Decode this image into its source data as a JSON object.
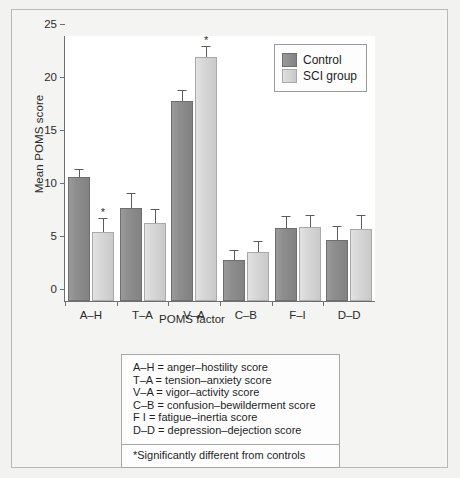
{
  "chart_data": {
    "type": "bar",
    "title": "",
    "xlabel": "POMS factor",
    "ylabel": "Mean POMS score",
    "ylim": [
      0,
      25
    ],
    "yticks": [
      0,
      5,
      10,
      15,
      20,
      25
    ],
    "grid": false,
    "legend_position": "top-right",
    "categories": [
      "A–H",
      "T–A",
      "V–A",
      "C–B",
      "F–I",
      "D–D"
    ],
    "series": [
      {
        "name": "Control",
        "color": "#8a8a8a",
        "values": [
          11.7,
          8.8,
          18.9,
          3.9,
          6.9,
          5.8
        ],
        "errors": [
          0.7,
          1.3,
          0.9,
          0.8,
          1.0,
          1.2
        ],
        "significant": [
          false,
          false,
          false,
          false,
          false,
          false
        ]
      },
      {
        "name": "SCI group",
        "color": "#d4d4d4",
        "values": [
          6.5,
          7.4,
          23.0,
          4.6,
          7.0,
          6.8
        ],
        "errors": [
          1.2,
          1.2,
          1.0,
          1.0,
          1.0,
          1.2
        ],
        "significant": [
          true,
          false,
          true,
          false,
          false,
          false
        ]
      }
    ],
    "annotations": [
      {
        "marker": "*",
        "category": "A–H",
        "series": "SCI group"
      },
      {
        "marker": "*",
        "category": "V–A",
        "series": "SCI group"
      }
    ]
  },
  "legend": {
    "items": [
      {
        "label": "Control",
        "swatch": "control"
      },
      {
        "label": "SCI group",
        "swatch": "sci"
      }
    ]
  },
  "key_box": {
    "lines": [
      "A–H = anger–hostility score",
      "T–A = tension–anxiety score",
      "V–A = vigor–activity score",
      "C–B = confusion–bewilderment score",
      " F  I  = fatigue–inertia score",
      "D–D = depression–dejection score"
    ]
  },
  "note_box": {
    "text": "*Significantly different from controls"
  }
}
